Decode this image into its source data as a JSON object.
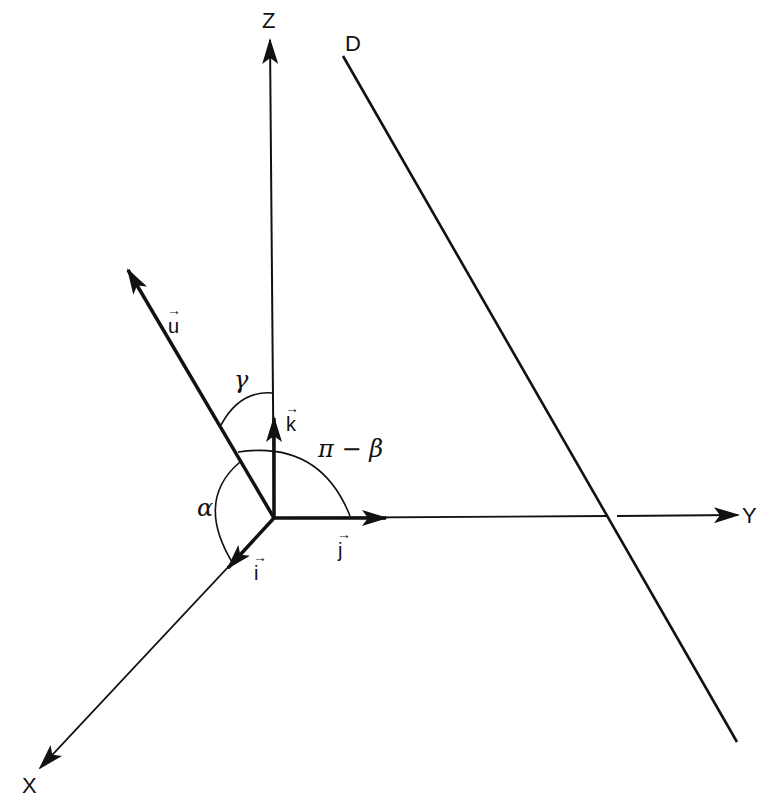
{
  "diagram": {
    "axes": [
      {
        "name": "X",
        "label": "X"
      },
      {
        "name": "Y",
        "label": "Y"
      },
      {
        "name": "Z",
        "label": "Z"
      }
    ],
    "line_label": "D",
    "vectors": {
      "u": "u",
      "i": "i",
      "j": "j",
      "k": "k",
      "arrow_glyph": "→"
    },
    "angles": {
      "alpha": "α",
      "gamma": "γ",
      "pi_minus_beta": "π − β"
    },
    "colors": {
      "stroke": "#111111",
      "background": "#ffffff"
    }
  }
}
